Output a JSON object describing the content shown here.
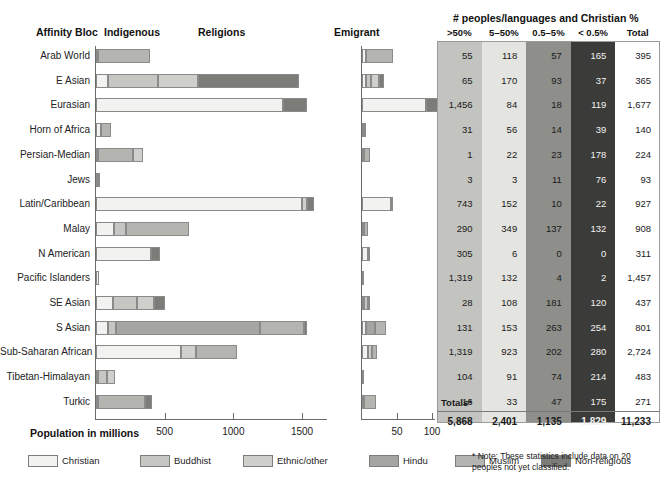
{
  "headers": {
    "affinity_bloc": "Affinity Bloc",
    "indigenous": "Indigenous",
    "religions": "Religions",
    "emigrant": "Emigrant",
    "table_title": "# peoples/languages and Christian %"
  },
  "axes": {
    "main_label": "Population in millions",
    "main_ticks": [
      "500",
      "1000",
      "1500"
    ],
    "emigrant_ticks": [
      "50",
      "100"
    ]
  },
  "legend": [
    {
      "label": "Christian",
      "color": "#f2f2f0"
    },
    {
      "label": "Buddhist",
      "color": "#c6c6c2"
    },
    {
      "label": "Ethnic/other",
      "color": "#cfcfcb"
    },
    {
      "label": "Hindu",
      "color": "#a5a5a1"
    },
    {
      "label": "Muslim",
      "color": "#b4b4b0"
    },
    {
      "label": "Non-religious",
      "color": "#7c7c78"
    }
  ],
  "table": {
    "columns": [
      ">50%",
      "5–50%",
      "0.5–5%",
      "< 0.5%",
      "Total"
    ],
    "column_colors": [
      "#c3c3bf",
      "#e4e4e0",
      "#8e8e8a",
      "#3b3b39",
      "#ffffff"
    ],
    "column_text_colors": [
      "#1a1a1a",
      "#1a1a1a",
      "#1a1a1a",
      "#f2f2f0",
      "#1a1a1a"
    ],
    "totals_label": "Totals*",
    "totals": [
      "5,868",
      "2,401",
      "1,135",
      "1,829",
      "11,233"
    ],
    "note": "* Note: These statistics include data on 20 peoples not yet classified."
  },
  "chart_data": {
    "type": "bar",
    "xlabel": "Population in millions",
    "ylabel": "Affinity Bloc",
    "xlim_indigenous": [
      0,
      1750
    ],
    "xlim_emigrant": [
      0,
      115
    ],
    "grid": false,
    "legend_position": "bottom",
    "series_names": [
      "Christian",
      "Buddhist",
      "Ethnic/other",
      "Hindu",
      "Muslim",
      "Non-religious"
    ],
    "categories": [
      "Arab World",
      "E Asian",
      "Eurasian",
      "Horn of Africa",
      "Persian-Median",
      "Jews",
      "Latin/Caribbean",
      "Malay",
      "N American",
      "Pacific Islanders",
      "SE Asian",
      "S Asian",
      "Sub-Saharan African",
      "Tibetan-Himalayan",
      "Turkic"
    ],
    "indigenous": [
      {
        "bloc": "Arab World",
        "segments": [
          {
            "name": "Christian",
            "value": 12
          },
          {
            "name": "Muslim",
            "value": 380
          }
        ]
      },
      {
        "bloc": "E Asian",
        "segments": [
          {
            "name": "Christian",
            "value": 85
          },
          {
            "name": "Buddhist",
            "value": 370
          },
          {
            "name": "Ethnic/other",
            "value": 285
          },
          {
            "name": "Non-religious",
            "value": 740
          }
        ]
      },
      {
        "bloc": "Eurasian",
        "segments": [
          {
            "name": "Christian",
            "value": 1360
          },
          {
            "name": "Non-religious",
            "value": 175
          }
        ]
      },
      {
        "bloc": "Horn of Africa",
        "segments": [
          {
            "name": "Christian",
            "value": 35
          },
          {
            "name": "Muslim",
            "value": 75
          }
        ]
      },
      {
        "bloc": "Persian-Median",
        "segments": [
          {
            "name": "Christian",
            "value": 5
          },
          {
            "name": "Muslim",
            "value": 255
          },
          {
            "name": "Ethnic/other",
            "value": 75
          }
        ]
      },
      {
        "bloc": "Jews",
        "segments": [
          {
            "name": "Christian",
            "value": 5
          },
          {
            "name": "Ethnic/other",
            "value": 15
          }
        ]
      },
      {
        "bloc": "Latin/Caribbean",
        "segments": [
          {
            "name": "Christian",
            "value": 1500
          },
          {
            "name": "Ethnic/other",
            "value": 40
          },
          {
            "name": "Non-religious",
            "value": 45
          }
        ]
      },
      {
        "bloc": "Malay",
        "segments": [
          {
            "name": "Christian",
            "value": 130
          },
          {
            "name": "Buddhist",
            "value": 85
          },
          {
            "name": "Muslim",
            "value": 460
          }
        ]
      },
      {
        "bloc": "N American",
        "segments": [
          {
            "name": "Christian",
            "value": 400
          },
          {
            "name": "Non-religious",
            "value": 65
          }
        ]
      },
      {
        "bloc": "Pacific Islanders",
        "segments": [
          {
            "name": "Christian",
            "value": 22
          }
        ]
      },
      {
        "bloc": "SE Asian",
        "segments": [
          {
            "name": "Christian",
            "value": 125
          },
          {
            "name": "Buddhist",
            "value": 170
          },
          {
            "name": "Ethnic/other",
            "value": 130
          },
          {
            "name": "Non-religious",
            "value": 80
          }
        ]
      },
      {
        "bloc": "S Asian",
        "segments": [
          {
            "name": "Christian",
            "value": 90
          },
          {
            "name": "Buddhist",
            "value": 55
          },
          {
            "name": "Hindu",
            "value": 1050
          },
          {
            "name": "Muslim",
            "value": 320
          },
          {
            "name": "Non-religious",
            "value": 25
          }
        ]
      },
      {
        "bloc": "Sub-Saharan African",
        "segments": [
          {
            "name": "Christian",
            "value": 620
          },
          {
            "name": "Ethnic/other",
            "value": 110
          },
          {
            "name": "Muslim",
            "value": 300
          }
        ]
      },
      {
        "bloc": "Tibetan-Himalayan",
        "segments": [
          {
            "name": "Christian",
            "value": 10
          },
          {
            "name": "Buddhist",
            "value": 70
          },
          {
            "name": "Ethnic/other",
            "value": 55
          }
        ]
      },
      {
        "bloc": "Turkic",
        "segments": [
          {
            "name": "Christian",
            "value": 15
          },
          {
            "name": "Muslim",
            "value": 345
          },
          {
            "name": "Non-religious",
            "value": 45
          }
        ]
      }
    ],
    "emigrant": [
      {
        "bloc": "Arab World",
        "segments": [
          {
            "name": "Christian",
            "value": 6
          },
          {
            "name": "Muslim",
            "value": 38
          }
        ]
      },
      {
        "bloc": "E Asian",
        "segments": [
          {
            "name": "Christian",
            "value": 5
          },
          {
            "name": "Buddhist",
            "value": 8
          },
          {
            "name": "Ethnic/other",
            "value": 11
          },
          {
            "name": "Non-religious",
            "value": 8
          }
        ]
      },
      {
        "bloc": "Eurasian",
        "segments": [
          {
            "name": "Christian",
            "value": 92
          },
          {
            "name": "Non-religious",
            "value": 22
          }
        ]
      },
      {
        "bloc": "Horn of Africa",
        "segments": [
          {
            "name": "Christian",
            "value": 1
          },
          {
            "name": "Muslim",
            "value": 2
          }
        ]
      },
      {
        "bloc": "Persian-Median",
        "segments": [
          {
            "name": "Christian",
            "value": 2
          },
          {
            "name": "Muslim",
            "value": 9
          }
        ]
      },
      {
        "bloc": "Jews",
        "segments": []
      },
      {
        "bloc": "Latin/Caribbean",
        "segments": [
          {
            "name": "Christian",
            "value": 42
          },
          {
            "name": "Non-religious",
            "value": 3
          }
        ]
      },
      {
        "bloc": "Malay",
        "segments": [
          {
            "name": "Christian",
            "value": 3
          },
          {
            "name": "Muslim",
            "value": 6
          }
        ]
      },
      {
        "bloc": "N American",
        "segments": [
          {
            "name": "Christian",
            "value": 8
          },
          {
            "name": "Non-religious",
            "value": 3
          }
        ]
      },
      {
        "bloc": "Pacific Islanders",
        "segments": [
          {
            "name": "Christian",
            "value": 2
          }
        ]
      },
      {
        "bloc": "SE Asian",
        "segments": [
          {
            "name": "Christian",
            "value": 1
          },
          {
            "name": "Buddhist",
            "value": 6
          },
          {
            "name": "Non-religious",
            "value": 3
          }
        ]
      },
      {
        "bloc": "S Asian",
        "segments": [
          {
            "name": "Christian",
            "value": 6
          },
          {
            "name": "Hindu",
            "value": 13
          },
          {
            "name": "Muslim",
            "value": 16
          }
        ]
      },
      {
        "bloc": "Sub-Saharan African",
        "segments": [
          {
            "name": "Christian",
            "value": 9
          },
          {
            "name": "Ethnic/other",
            "value": 5
          },
          {
            "name": "Muslim",
            "value": 8
          }
        ]
      },
      {
        "bloc": "Tibetan-Himalayan",
        "segments": [
          {
            "name": "Christian",
            "value": 1
          }
        ]
      },
      {
        "bloc": "Turkic",
        "segments": [
          {
            "name": "Christian",
            "value": 2
          },
          {
            "name": "Muslim",
            "value": 18
          }
        ]
      }
    ],
    "table_rows": [
      {
        "bloc": "Arab World",
        "gt50": "55",
        "p5_50": "118",
        "p05_5": "57",
        "lt05": "165",
        "total": "395"
      },
      {
        "bloc": "E Asian",
        "gt50": "65",
        "p5_50": "170",
        "p05_5": "93",
        "lt05": "37",
        "total": "365"
      },
      {
        "bloc": "Eurasian",
        "gt50": "1,456",
        "p5_50": "84",
        "p05_5": "18",
        "lt05": "119",
        "total": "1,677"
      },
      {
        "bloc": "Horn of Africa",
        "gt50": "31",
        "p5_50": "56",
        "p05_5": "14",
        "lt05": "39",
        "total": "140"
      },
      {
        "bloc": "Persian-Median",
        "gt50": "1",
        "p5_50": "22",
        "p05_5": "23",
        "lt05": "178",
        "total": "224"
      },
      {
        "bloc": "Jews",
        "gt50": "3",
        "p5_50": "3",
        "p05_5": "11",
        "lt05": "76",
        "total": "93"
      },
      {
        "bloc": "Latin/Caribbean",
        "gt50": "743",
        "p5_50": "152",
        "p05_5": "10",
        "lt05": "22",
        "total": "927"
      },
      {
        "bloc": "Malay",
        "gt50": "290",
        "p5_50": "349",
        "p05_5": "137",
        "lt05": "132",
        "total": "908"
      },
      {
        "bloc": "N American",
        "gt50": "305",
        "p5_50": "6",
        "p05_5": "0",
        "lt05": "0",
        "total": "311"
      },
      {
        "bloc": "Pacific Islanders",
        "gt50": "1,319",
        "p5_50": "132",
        "p05_5": "4",
        "lt05": "2",
        "total": "1,457"
      },
      {
        "bloc": "SE Asian",
        "gt50": "28",
        "p5_50": "108",
        "p05_5": "181",
        "lt05": "120",
        "total": "437"
      },
      {
        "bloc": "S Asian",
        "gt50": "131",
        "p5_50": "153",
        "p05_5": "263",
        "lt05": "254",
        "total": "801"
      },
      {
        "bloc": "Sub-Saharan African",
        "gt50": "1,319",
        "p5_50": "923",
        "p05_5": "202",
        "lt05": "280",
        "total": "2,724"
      },
      {
        "bloc": "Tibetan-Himalayan",
        "gt50": "104",
        "p5_50": "91",
        "p05_5": "74",
        "lt05": "214",
        "total": "483"
      },
      {
        "bloc": "Turkic",
        "gt50": "16",
        "p5_50": "33",
        "p05_5": "47",
        "lt05": "175",
        "total": "271"
      }
    ]
  }
}
